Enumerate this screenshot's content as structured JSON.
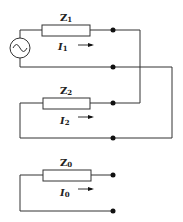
{
  "diagram": {
    "type": "circuit",
    "components": [
      {
        "id": "source",
        "kind": "ac-voltage-source",
        "symbol": "~"
      },
      {
        "id": "Z1",
        "label": "Z",
        "subscript": "1",
        "current_label": "I",
        "current_subscript": "1"
      },
      {
        "id": "Z2",
        "label": "Z",
        "subscript": "2",
        "current_label": "I",
        "current_subscript": "2"
      },
      {
        "id": "Z0",
        "label": "Z",
        "subscript": "0",
        "current_label": "I",
        "current_subscript": "0"
      }
    ],
    "colors": {
      "wire": "#333333",
      "dot": "#111111",
      "background": "#ffffff"
    }
  }
}
